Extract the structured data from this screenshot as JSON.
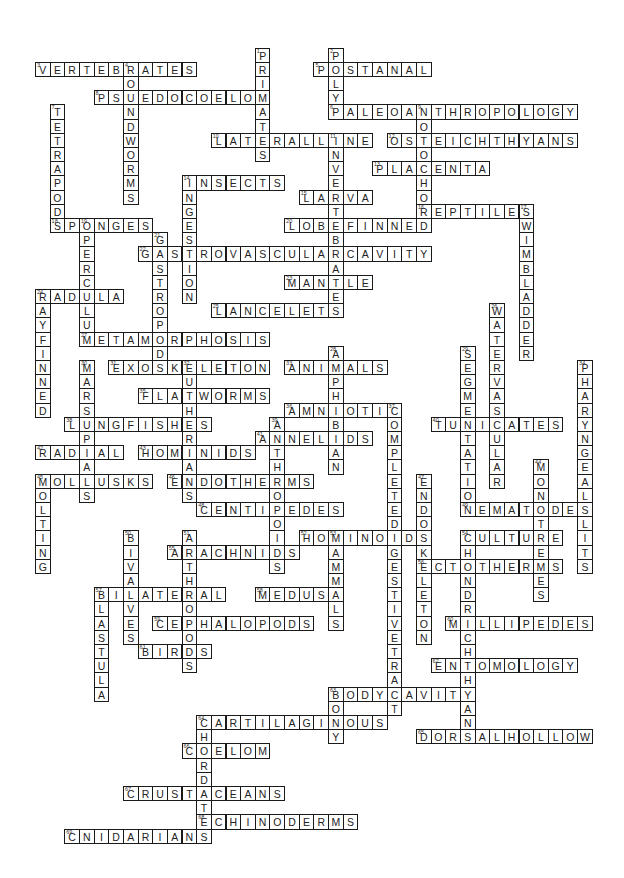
{
  "puzzle": {
    "title": "Crossword",
    "grid": {
      "origin_x": 35,
      "origin_y": 47.6,
      "cell_w": 14.65,
      "cell_h": 14.2
    },
    "words": [
      {
        "num": 1,
        "answer": "PRIMATES",
        "dir": "down",
        "row": 0,
        "col": 15
      },
      {
        "num": 2,
        "answer": "POLYP",
        "dir": "down",
        "row": 0,
        "col": 20
      },
      {
        "num": 3,
        "answer": "VERTEBRATES",
        "dir": "across",
        "row": 1,
        "col": 0
      },
      {
        "num": 4,
        "answer": "ROUNDWORMS",
        "dir": "down",
        "row": 1,
        "col": 6
      },
      {
        "num": 5,
        "answer": "POSTANAL",
        "dir": "across",
        "row": 1,
        "col": 19
      },
      {
        "num": 8,
        "answer": "PSUEDOCOELOM",
        "dir": "across",
        "row": 3,
        "col": 4
      },
      {
        "num": 7,
        "answer": "TETRAPODS",
        "dir": "down",
        "row": 4,
        "col": 1
      },
      {
        "num": 6,
        "answer": "PALEOANTHROPOLOGY",
        "dir": "across",
        "row": 4,
        "col": 20
      },
      {
        "num": 9,
        "answer": "NOTOCHORD",
        "dir": "down",
        "row": 4,
        "col": 26
      },
      {
        "num": 10,
        "answer": "LATERALLINE",
        "dir": "across",
        "row": 6,
        "col": 12
      },
      {
        "num": 11,
        "answer": "INVERTEBRATES",
        "dir": "down",
        "row": 6,
        "col": 20
      },
      {
        "num": 12,
        "answer": "OSTEICHTHYANS",
        "dir": "across",
        "row": 6,
        "col": 24
      },
      {
        "num": 13,
        "answer": "PLACENTA",
        "dir": "across",
        "row": 8,
        "col": 23
      },
      {
        "num": 14,
        "answer": "INSECTS",
        "dir": "across",
        "row": 9,
        "col": 10
      },
      {
        "num": 14,
        "answer": "INGESTION",
        "dir": "down",
        "row": 9,
        "col": 10
      },
      {
        "num": 15,
        "answer": "LARVA",
        "dir": "across",
        "row": 10,
        "col": 18
      },
      {
        "num": 16,
        "answer": "REPTILES",
        "dir": "across",
        "row": 11,
        "col": 26
      },
      {
        "num": 17,
        "answer": "SWIMBLADDER",
        "dir": "down",
        "row": 11,
        "col": 33
      },
      {
        "num": 18,
        "answer": "SPONGES",
        "dir": "across",
        "row": 12,
        "col": 1
      },
      {
        "num": 19,
        "answer": "OPERCULUM",
        "dir": "down",
        "row": 12,
        "col": 3
      },
      {
        "num": 20,
        "answer": "LOBEFINNED",
        "dir": "across",
        "row": 12,
        "col": 17
      },
      {
        "num": 21,
        "answer": "GASTROPODS",
        "dir": "down",
        "row": 13,
        "col": 8
      },
      {
        "num": 22,
        "answer": "GASTROVASCULARCAVITY",
        "dir": "across",
        "row": 14,
        "col": 7
      },
      {
        "num": 23,
        "answer": "MANTLE",
        "dir": "across",
        "row": 16,
        "col": 17
      },
      {
        "num": 24,
        "answer": "RADULA",
        "dir": "across",
        "row": 17,
        "col": 0
      },
      {
        "num": 24,
        "answer": "RAYFINNED",
        "dir": "down",
        "row": 17,
        "col": 0
      },
      {
        "num": 25,
        "answer": "LANCELETS",
        "dir": "across",
        "row": 18,
        "col": 12
      },
      {
        "num": 26,
        "answer": "WATERVASCULAR",
        "dir": "down",
        "row": 18,
        "col": 31
      },
      {
        "num": 27,
        "answer": "METAMORPHOSIS",
        "dir": "across",
        "row": 20,
        "col": 3
      },
      {
        "num": 28,
        "answer": "AMPHIBIAN",
        "dir": "down",
        "row": 21,
        "col": 20
      },
      {
        "num": 29,
        "answer": "SEGMENTATION",
        "dir": "down",
        "row": 21,
        "col": 29
      },
      {
        "num": 30,
        "answer": "MARSUPIALS",
        "dir": "down",
        "row": 22,
        "col": 3
      },
      {
        "num": 31,
        "answer": "EXOSKELETON",
        "dir": "across",
        "row": 22,
        "col": 5
      },
      {
        "num": 32,
        "answer": "EUTHERIANS",
        "dir": "down",
        "row": 22,
        "col": 10
      },
      {
        "num": 33,
        "answer": "ANIMALS",
        "dir": "across",
        "row": 22,
        "col": 17
      },
      {
        "num": 34,
        "answer": "PHARYNGEALSLITS",
        "dir": "down",
        "row": 22,
        "col": 37
      },
      {
        "num": 35,
        "answer": "FLATWORMS",
        "dir": "across",
        "row": 24,
        "col": 7
      },
      {
        "num": 36,
        "answer": "AMNIOTIC",
        "dir": "across",
        "row": 25,
        "col": 17
      },
      {
        "num": 37,
        "answer": "COMPLETEDIGESTIVETRACT",
        "dir": "down",
        "row": 25,
        "col": 24
      },
      {
        "num": 38,
        "answer": "LUNGFISHES",
        "dir": "across",
        "row": 26,
        "col": 2
      },
      {
        "num": 39,
        "answer": "ANTHROPOIDS",
        "dir": "down",
        "row": 26,
        "col": 16
      },
      {
        "num": 40,
        "answer": "TUNICATES",
        "dir": "across",
        "row": 26,
        "col": 27
      },
      {
        "num": 41,
        "answer": "ANNELIDS",
        "dir": "across",
        "row": 27,
        "col": 15
      },
      {
        "num": 42,
        "answer": "RADIAL",
        "dir": "across",
        "row": 28,
        "col": 0
      },
      {
        "num": 43,
        "answer": "HOMINIDS",
        "dir": "across",
        "row": 28,
        "col": 7
      },
      {
        "num": 44,
        "answer": "MONOTREMES",
        "dir": "down",
        "row": 29,
        "col": 34
      },
      {
        "num": 45,
        "answer": "MOLLUSKS",
        "dir": "across",
        "row": 30,
        "col": 0
      },
      {
        "num": 45,
        "answer": "MOLTING",
        "dir": "down",
        "row": 30,
        "col": 0
      },
      {
        "num": 46,
        "answer": "ENDOTHERMS",
        "dir": "across",
        "row": 30,
        "col": 9
      },
      {
        "num": 47,
        "answer": "ENDOSKELETON",
        "dir": "down",
        "row": 30,
        "col": 26
      },
      {
        "num": 48,
        "answer": "CENTIPEDES",
        "dir": "across",
        "row": 32,
        "col": 11
      },
      {
        "num": 49,
        "answer": "NEMATODES",
        "dir": "across",
        "row": 32,
        "col": 29
      },
      {
        "num": 50,
        "answer": "BIVALVES",
        "dir": "down",
        "row": 34,
        "col": 6
      },
      {
        "num": 51,
        "answer": "ARTHROPODS",
        "dir": "down",
        "row": 34,
        "col": 10
      },
      {
        "num": 52,
        "answer": "HOMINOIDS",
        "dir": "across",
        "row": 34,
        "col": 18
      },
      {
        "num": 53,
        "answer": "MAMMALS",
        "dir": "down",
        "row": 34,
        "col": 20
      },
      {
        "num": 54,
        "answer": "CULTURE",
        "dir": "across",
        "row": 34,
        "col": 29
      },
      {
        "num": 54,
        "answer": "CHONDRICHTHYAN",
        "dir": "down",
        "row": 34,
        "col": 29
      },
      {
        "num": 55,
        "answer": "ARACHNIDS",
        "dir": "across",
        "row": 35,
        "col": 9
      },
      {
        "num": 56,
        "answer": "ECTOTHERMS",
        "dir": "across",
        "row": 36,
        "col": 26
      },
      {
        "num": 57,
        "answer": "BILATERAL",
        "dir": "across",
        "row": 38,
        "col": 4
      },
      {
        "num": 57,
        "answer": "BLASTULA",
        "dir": "down",
        "row": 38,
        "col": 4
      },
      {
        "num": 58,
        "answer": "MEDUSA",
        "dir": "across",
        "row": 38,
        "col": 15
      },
      {
        "num": 59,
        "answer": "CEPHALOPODS",
        "dir": "across",
        "row": 40,
        "col": 8
      },
      {
        "num": 60,
        "answer": "MILLIPEDES",
        "dir": "across",
        "row": 40,
        "col": 28
      },
      {
        "num": 61,
        "answer": "BIRDS",
        "dir": "across",
        "row": 42,
        "col": 7
      },
      {
        "num": 62,
        "answer": "ENTOMOLOGY",
        "dir": "across",
        "row": 43,
        "col": 27
      },
      {
        "num": 63,
        "answer": "BODYCAVITY",
        "dir": "across",
        "row": 45,
        "col": 20
      },
      {
        "num": 63,
        "answer": "BONY",
        "dir": "down",
        "row": 45,
        "col": 20
      },
      {
        "num": 64,
        "answer": "CARTILAGINOUS",
        "dir": "across",
        "row": 47,
        "col": 11
      },
      {
        "num": 64,
        "answer": "CHORDATES",
        "dir": "down",
        "row": 47,
        "col": 11
      },
      {
        "num": 65,
        "answer": "DORSALHOLLOW",
        "dir": "across",
        "row": 48,
        "col": 26
      },
      {
        "num": 66,
        "answer": "COELOM",
        "dir": "across",
        "row": 49,
        "col": 10
      },
      {
        "num": 67,
        "answer": "CRUSTACEANS",
        "dir": "across",
        "row": 52,
        "col": 6
      },
      {
        "num": 68,
        "answer": "ECHINODERMS",
        "dir": "across",
        "row": 54,
        "col": 11
      },
      {
        "num": 69,
        "answer": "CNIDARIANS",
        "dir": "across",
        "row": 55,
        "col": 2
      }
    ]
  }
}
